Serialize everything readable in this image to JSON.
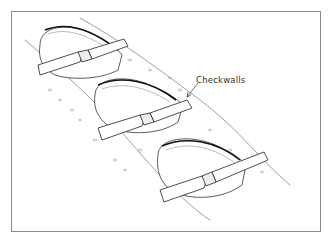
{
  "figure": {
    "label": "Checkwalls",
    "colors": {
      "ink": "#222222",
      "frame": "#8a8a8a",
      "background": "#ffffff"
    },
    "elements": [
      {
        "name": "basin-1",
        "checkwall": "checkwall-1"
      },
      {
        "name": "basin-2",
        "checkwall": "checkwall-2"
      },
      {
        "name": "basin-3",
        "checkwall": "checkwall-3"
      }
    ]
  }
}
